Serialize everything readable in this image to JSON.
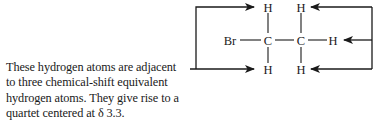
{
  "structure": {
    "name": "bromoethane",
    "atoms": {
      "br": "Br",
      "c1": "C",
      "c2": "C",
      "h_c1_top": "H",
      "h_c1_bottom": "H",
      "h_c2_top": "H",
      "h_c2_right": "H",
      "h_c2_bottom": "H"
    }
  },
  "caption": {
    "lines": [
      "These hydrogen atoms are adjacent",
      "to three chemical-shift equivalent",
      "hydrogen atoms.  They give rise to a",
      "quartet centered at δ 3.3."
    ]
  },
  "colors": {
    "ink": "#1a1a1a",
    "background": "#ffffff"
  }
}
